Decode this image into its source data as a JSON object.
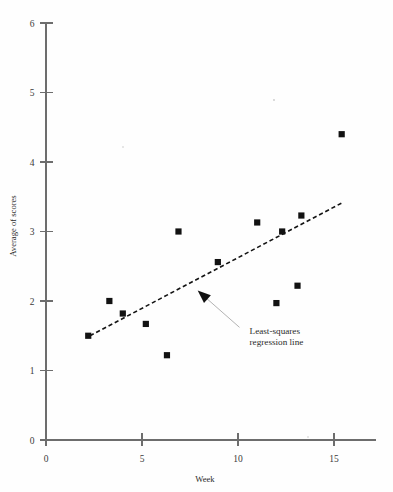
{
  "chart_data": {
    "type": "scatter",
    "title": "",
    "xlabel": "Week",
    "ylabel": "Average of scores",
    "xlim": [
      0,
      17
    ],
    "ylim": [
      0,
      6
    ],
    "xticks": [
      0,
      5,
      10,
      15
    ],
    "xtick_labels": [
      "0",
      "5",
      "10",
      "15"
    ],
    "yticks": [
      0,
      1,
      2,
      3,
      4,
      5,
      6
    ],
    "ytick_labels": [
      "0",
      "1",
      "2",
      "3",
      "4",
      "5",
      "6"
    ],
    "grid": false,
    "legend": null,
    "marker": "square",
    "marker_color": "#121212",
    "points": [
      {
        "x": 2.2,
        "y": 1.5
      },
      {
        "x": 3.3,
        "y": 2.0
      },
      {
        "x": 4.0,
        "y": 1.82
      },
      {
        "x": 5.2,
        "y": 1.67
      },
      {
        "x": 6.3,
        "y": 1.22
      },
      {
        "x": 6.9,
        "y": 3.0
      },
      {
        "x": 8.95,
        "y": 2.56
      },
      {
        "x": 11.0,
        "y": 3.13
      },
      {
        "x": 12.0,
        "y": 1.97
      },
      {
        "x": 12.3,
        "y": 3.0
      },
      {
        "x": 13.1,
        "y": 2.22
      },
      {
        "x": 13.3,
        "y": 3.23
      },
      {
        "x": 15.4,
        "y": 4.4
      }
    ],
    "series": [
      {
        "name": "Least-squares regression line",
        "type": "line",
        "style": "dashed",
        "color": "#141414",
        "x_start": 2.29,
        "y_start": 1.5,
        "x_end": 15.47,
        "y_end": 3.42
      }
    ],
    "annotations": [
      {
        "text_line_1": "Least-squares",
        "text_line_2": "regression line",
        "target_x": 7.9,
        "target_y": 2.15,
        "text_x": 10.6,
        "text_y": 1.52
      }
    ]
  },
  "axes": {
    "x_axis_label": "Week",
    "y_axis_label": "Average of scores"
  }
}
